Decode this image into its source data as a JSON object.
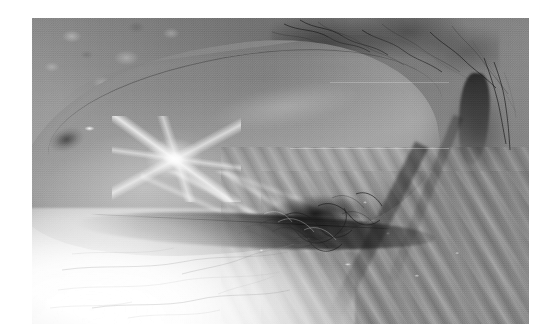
{
  "page": {
    "background_color": "#ffffff",
    "width_px": 546,
    "height_px": 335
  },
  "figure": {
    "name": "clinical-photograph",
    "kind": "photograph",
    "color_mode": "grayscale",
    "frame": {
      "left_px": 32,
      "top_px": 18,
      "width_px": 497,
      "height_px": 306
    },
    "caption": "",
    "label": "",
    "visible_text": "",
    "palette": {
      "page_white": "#ffffff",
      "pale_skin": "#f2f2f2",
      "light_gray": "#c9c9c9",
      "mid_gray": "#9d9d9d",
      "base_gray": "#8d8d8d",
      "shadow_gray": "#5a5a5a",
      "dark_gray": "#2c2c2c",
      "near_black": "#141414",
      "specular_white": "#ffffff"
    },
    "regions": [
      {
        "name": "upper-skin-field",
        "description": "Mottled mid-gray skin with coarse blotchy texture occupying the upper-left band",
        "tone": "mid_gray"
      },
      {
        "name": "hair-band-top",
        "description": "Wispy dark hair strands sweeping across the upper edge toward the right",
        "tone": "dark_gray"
      },
      {
        "name": "central-mass",
        "description": "Large elongated rounded mass with a smooth convex upper contour running from lower-left to upper-right",
        "tone": "mid_gray"
      },
      {
        "name": "specular-highlight",
        "description": "Bright starburst specular reflection on the left-central surface of the mass indicating a glistening wet surface",
        "tone": "specular_white"
      },
      {
        "name": "surface-streak-highlights",
        "description": "Secondary elongated glossy streaks across the lower belly of the mass",
        "tone": "light_gray"
      },
      {
        "name": "inferior-crease",
        "description": "Sharp dark linear crease marking the underside boundary of the mass, with curly hair strands clustered at its right end",
        "tone": "near_black"
      },
      {
        "name": "pale-skin-lower-left",
        "description": "Very pale, almost white skin field in the lower-left with faint thin hair lines",
        "tone": "pale_skin"
      },
      {
        "name": "vertical-cleft-right",
        "description": "Dark vertical fold or cleft in the upper-right portion of the field",
        "tone": "near_black"
      },
      {
        "name": "diagonal-rugae",
        "description": "Parallel diagonal wrinkle folds with small specular highlights filling the lower-right quadrant",
        "tone": "shadow_gray"
      },
      {
        "name": "film-grain",
        "description": "Fine halftone print speckle over the entire photograph",
        "tone": "mid_gray"
      }
    ]
  }
}
